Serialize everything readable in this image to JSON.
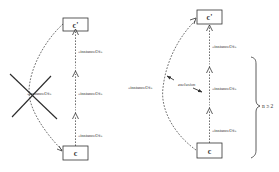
{
  "diagram": {
    "left": {
      "top_node": "c'",
      "bottom_node": "c",
      "chain_labels": [
        "«instanceOf»",
        "«instanceOf»",
        "«instanceOf»"
      ],
      "direct_label": "«instanceOf»",
      "direct_crossed_out": true
    },
    "right": {
      "top_node": "c'",
      "bottom_node": "c",
      "chain_labels": [
        "«instanceOf»",
        "«instanceOf»",
        "«instanceOf»"
      ],
      "direct_label": "«instanceOf»",
      "exclusion_label": "exclusion",
      "brace_label": "n ≥ 2"
    },
    "colors": {
      "line": "#333333",
      "cross": "#2b2b2b",
      "text": "#333333",
      "background": "#ffffff"
    }
  }
}
